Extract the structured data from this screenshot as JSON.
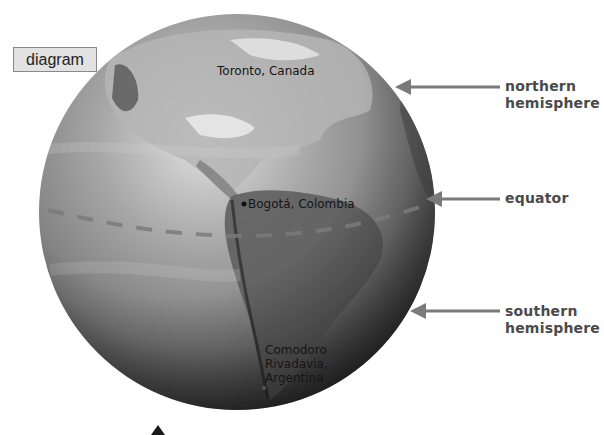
{
  "tag": {
    "label": "diagram"
  },
  "globe": {
    "center": [
      237,
      212
    ],
    "radius": 198,
    "colors": {
      "light": "#d9d9d9",
      "mid": "#8c8c8c",
      "dark": "#2e2e2e",
      "land": "#6f6f6f",
      "ice": "#f2f2f2"
    }
  },
  "equator": {
    "color": "#7a7a7a",
    "style": "dashed"
  },
  "callouts": [
    {
      "id": "northern",
      "line1": "northern",
      "line2": "hemisphere",
      "arrow_y": 87,
      "arrow_tip_x": 395
    },
    {
      "id": "equator",
      "line1": "equator",
      "line2": "",
      "arrow_y": 199,
      "arrow_tip_x": 426
    },
    {
      "id": "southern",
      "line1": "southern",
      "line2": "hemisphere",
      "arrow_y": 311,
      "arrow_tip_x": 410
    }
  ],
  "cities": [
    {
      "name": "Toronto, Canada"
    },
    {
      "name": "Bogotá, Colombia"
    },
    {
      "line1": "Comodoro",
      "line2": "Rivadavia,",
      "line3": "Argentina"
    }
  ],
  "arrow_color": "#7a7a7a"
}
